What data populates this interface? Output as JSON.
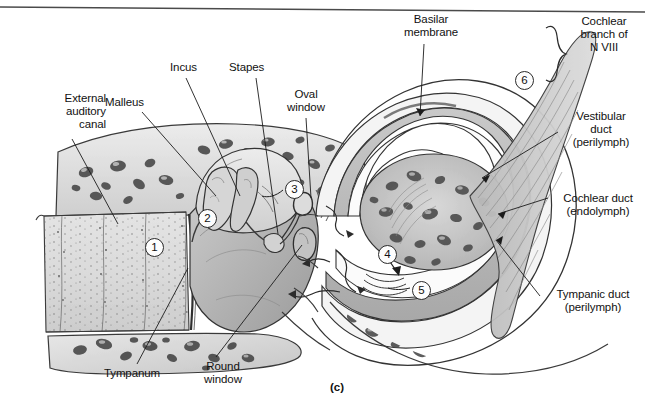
{
  "figure": {
    "caption": "(c)"
  },
  "labels": [
    {
      "id": "external-auditory-canal",
      "text": "External\nauditory\ncanal",
      "align": "right",
      "x": 12,
      "y": 92,
      "w": 94
    },
    {
      "id": "malleus",
      "text": "Malleus",
      "align": "left",
      "x": 105,
      "y": 96,
      "w": 70
    },
    {
      "id": "incus",
      "text": "Incus",
      "align": "left",
      "x": 170,
      "y": 61,
      "w": 50
    },
    {
      "id": "stapes",
      "text": "Stapes",
      "align": "left",
      "x": 229,
      "y": 61,
      "w": 55
    },
    {
      "id": "oval-window",
      "text": "Oval\nwindow",
      "align": "center",
      "x": 275,
      "y": 88,
      "w": 62
    },
    {
      "id": "basilar-membrane",
      "text": "Basilar\nmembrane",
      "align": "center",
      "x": 389,
      "y": 13,
      "w": 84
    },
    {
      "id": "cochlear-branch-n-viii",
      "text": "Cochlear\nbranch of\nN VIII",
      "align": "center",
      "x": 566,
      "y": 15,
      "w": 76
    },
    {
      "id": "vestibular-duct",
      "text": "Vestibular\nduct\n(perilymph)",
      "align": "center",
      "x": 560,
      "y": 110,
      "w": 82
    },
    {
      "id": "cochlear-duct",
      "text": "Cochlear duct\n(endolymph)",
      "align": "center",
      "x": 552,
      "y": 192,
      "w": 92
    },
    {
      "id": "tympanic-duct",
      "text": "Tympanic duct\n(perilymph)",
      "align": "center",
      "x": 543,
      "y": 288,
      "w": 100
    },
    {
      "id": "tympanum",
      "text": "Tympanum",
      "align": "center",
      "x": 92,
      "y": 367,
      "w": 80
    },
    {
      "id": "round-window",
      "text": "Round\nwindow",
      "align": "center",
      "x": 192,
      "y": 360,
      "w": 62
    }
  ],
  "markers": [
    {
      "id": "marker-1",
      "value": "1",
      "x": 145,
      "y": 238
    },
    {
      "id": "marker-2",
      "value": "2",
      "x": 198,
      "y": 209
    },
    {
      "id": "marker-3",
      "value": "3",
      "x": 285,
      "y": 180
    },
    {
      "id": "marker-4",
      "value": "4",
      "x": 378,
      "y": 245
    },
    {
      "id": "marker-5",
      "value": "5",
      "x": 412,
      "y": 281
    },
    {
      "id": "marker-6",
      "value": "6",
      "x": 515,
      "y": 71
    }
  ],
  "colors": {
    "background": "#ffffff",
    "ink": "#111111",
    "bone_fill": "#d9d9d9",
    "bone_light": "#e9e9e9",
    "duct_fill": "#b9b9b9",
    "tissue_mid": "#c2c2c2",
    "tissue_dark": "#9a9a9a",
    "nerve": "#cfcfcf",
    "canal_fill": "#dedede",
    "top_rule": "#444444"
  }
}
